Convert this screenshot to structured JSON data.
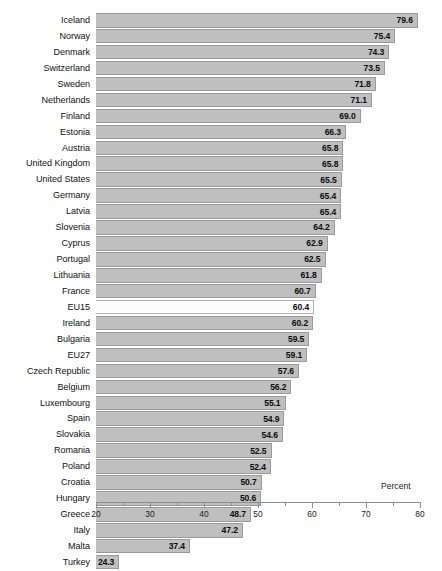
{
  "chart_data": {
    "type": "bar",
    "orientation": "horizontal",
    "title": "",
    "subtitle": "",
    "xlabel": "Percent",
    "ylabel": "",
    "xlim": [
      20,
      80
    ],
    "grid": false,
    "legend": null,
    "x_ticks": [
      20,
      30,
      40,
      50,
      60,
      70,
      80
    ],
    "x_tick_labels": [
      "20",
      "30",
      "40",
      "50",
      "60",
      "70",
      "80"
    ],
    "x_minor_ticks": [
      25,
      35,
      45,
      55,
      65,
      75
    ],
    "categories": [
      "Iceland",
      "Norway",
      "Denmark",
      "Switzerland",
      "Sweden",
      "Netherlands",
      "Finland",
      "Estonia",
      "Austria",
      "United Kingdom",
      "United States",
      "Germany",
      "Latvia",
      "Slovenia",
      "Cyprus",
      "Portugal",
      "Lithuania",
      "France",
      "EU15",
      "Ireland",
      "Bulgaria",
      "EU27",
      "Czech Republic",
      "Belgium",
      "Luxembourg",
      "Spain",
      "Slovakia",
      "Romania",
      "Poland",
      "Croatia",
      "Hungary",
      "Greece",
      "Italy",
      "Malta",
      "Turkey"
    ],
    "values": [
      79.6,
      75.4,
      74.3,
      73.5,
      71.8,
      71.1,
      69.0,
      66.3,
      65.8,
      65.8,
      65.5,
      65.4,
      65.4,
      64.2,
      62.9,
      62.5,
      61.8,
      60.7,
      60.4,
      60.2,
      59.5,
      59.1,
      57.6,
      56.2,
      55.1,
      54.9,
      54.6,
      52.5,
      52.4,
      50.7,
      50.6,
      48.7,
      47.2,
      37.4,
      24.3
    ],
    "value_labels": [
      "79.6",
      "75.4",
      "74.3",
      "73.5",
      "71.8",
      "71.1",
      "69.0",
      "66.3",
      "65.8",
      "65.8",
      "65.5",
      "65.4",
      "65.4",
      "64.2",
      "62.9",
      "62.5",
      "61.8",
      "60.7",
      "60.4",
      "60.2",
      "59.5",
      "59.1",
      "57.6",
      "56.2",
      "55.1",
      "54.9",
      "54.6",
      "52.5",
      "52.4",
      "50.7",
      "50.6",
      "48.7",
      "47.2",
      "37.4",
      "24.3"
    ],
    "highlighted_categories": [
      "EU15"
    ],
    "colors": {
      "bar_fill": "#bfbfbf",
      "bar_border": "#9a9a9a",
      "highlight_fill": "#fdfdfd",
      "axis": "#8d8d8d",
      "text": "#1a1a1a",
      "background": "#ffffff"
    }
  }
}
